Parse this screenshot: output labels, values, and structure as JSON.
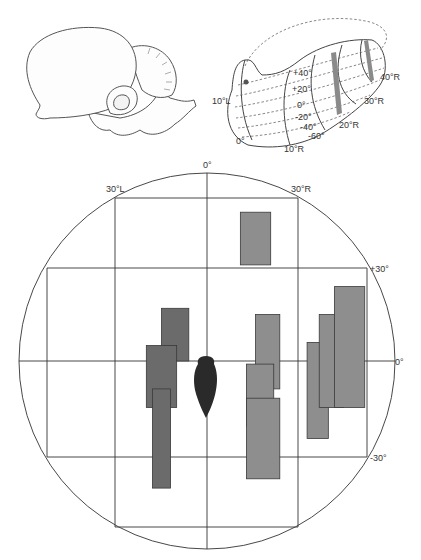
{
  "figure": {
    "brain_panel": {
      "name": "lateral brain view"
    },
    "tectum_panel": {
      "name": "tectal map projection",
      "elevation_labels": [
        "+40°",
        "+20°",
        "0°",
        "-20°",
        "-40°",
        "-60°"
      ],
      "azimuth_labels": [
        "10°L",
        "0°",
        "10°R",
        "20°R",
        "30°R",
        "40°R"
      ],
      "stripe_color": "#8a8a8a"
    },
    "field_map": {
      "top_label": "0°",
      "left_label": "30°L",
      "right_label": "30°R",
      "elev_labels": {
        "plus30": "+30°",
        "zero": "0°",
        "minus30": "-30°"
      },
      "colors": {
        "left_fields": "#6b6b6b",
        "right_fields": "#8e8e8e",
        "fish": "#2a2a2a",
        "lines": "#333333"
      }
    }
  },
  "chart_data": {
    "type": "diagram",
    "title": "",
    "axes": {
      "azimuth_deg": {
        "labels": [
          "30°L",
          "0°",
          "30°R"
        ],
        "range": [
          -60,
          60
        ]
      },
      "elevation_deg": {
        "labels": [
          "+30°",
          "0°",
          "-30°"
        ],
        "range": [
          -60,
          60
        ]
      }
    },
    "receptive_fields": [
      {
        "group": "left",
        "az": [
          -15,
          -6
        ],
        "el": [
          17,
          0
        ]
      },
      {
        "group": "left",
        "az": [
          -20,
          -10
        ],
        "el": [
          5,
          -15
        ]
      },
      {
        "group": "left",
        "az": [
          -18,
          -12
        ],
        "el": [
          -9,
          -41
        ]
      },
      {
        "group": "right",
        "az": [
          11,
          21
        ],
        "el": [
          48,
          31
        ]
      },
      {
        "group": "right",
        "az": [
          16,
          24
        ],
        "el": [
          15,
          -9
        ]
      },
      {
        "group": "right",
        "az": [
          13,
          22
        ],
        "el": [
          -1,
          -21
        ]
      },
      {
        "group": "right",
        "az": [
          13,
          24
        ],
        "el": [
          -12,
          -38
        ]
      },
      {
        "group": "right",
        "az": [
          33,
          40
        ],
        "el": [
          6,
          -25
        ]
      },
      {
        "group": "right",
        "az": [
          37,
          45
        ],
        "el": [
          15,
          -15
        ]
      },
      {
        "group": "right",
        "az": [
          42,
          52
        ],
        "el": [
          24,
          -15
        ]
      }
    ]
  }
}
